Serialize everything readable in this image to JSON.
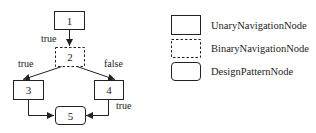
{
  "diagram": {
    "type": "flowchart",
    "stroke_color": "#222222",
    "background": "#ffffff",
    "nodes": [
      {
        "id": "1",
        "label": "1",
        "kind": "UnaryNavigationNode"
      },
      {
        "id": "2",
        "label": "2",
        "kind": "BinaryNavigationNode"
      },
      {
        "id": "3",
        "label": "3",
        "kind": "UnaryNavigationNode"
      },
      {
        "id": "4",
        "label": "4",
        "kind": "UnaryNavigationNode"
      },
      {
        "id": "5",
        "label": "5",
        "kind": "DesignPatternNode"
      }
    ],
    "edges": [
      {
        "from": "1",
        "to": "2",
        "label": "true"
      },
      {
        "from": "2",
        "to": "3",
        "label": "true"
      },
      {
        "from": "2",
        "to": "4",
        "label": "false"
      },
      {
        "from": "3",
        "to": "5",
        "label": ""
      },
      {
        "from": "4",
        "to": "5",
        "label": "true"
      }
    ]
  },
  "legend": {
    "items": [
      {
        "style": "solid-rect",
        "label": "UnaryNavigationNode"
      },
      {
        "style": "dashed-rect",
        "label": "BinaryNavigationNode"
      },
      {
        "style": "rounded-rect",
        "label": "DesignPatternNode"
      }
    ]
  }
}
